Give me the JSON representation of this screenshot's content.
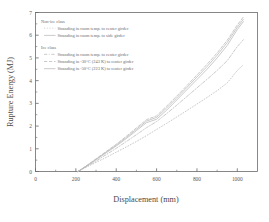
{
  "chart_data": {
    "type": "line",
    "title": "",
    "xlabel": "Displacement (mm)",
    "ylabel": "Rupture Energy (MJ)",
    "xlim": [
      0,
      1100
    ],
    "ylim": [
      0,
      7
    ],
    "xticks": [
      0,
      200,
      400,
      600,
      800,
      1000
    ],
    "yticks": [
      0,
      1,
      2,
      3,
      4,
      5,
      6,
      7
    ],
    "xtick_labels": [
      "0",
      "200",
      "400",
      "600",
      "800",
      "1000"
    ],
    "ytick_labels": [
      "0",
      "1",
      "2",
      "3",
      "4",
      "5",
      "6",
      "7"
    ],
    "grid": false,
    "legend_position": "upper-left",
    "legend_groups": [
      {
        "heading": "Non-ice class",
        "entries": [
          {
            "label": "Stranding in room temp. to center girder",
            "style": "dotted",
            "series": "noniceclass_room_center"
          },
          {
            "label": "Stranding in room temp. to side girder",
            "style": "solid",
            "series": "noniceclass_room_side"
          }
        ]
      },
      {
        "heading": "Ice class",
        "entries": [
          {
            "label": "Stranding in room temp. to center girder",
            "style": "dashdot",
            "series": "iceclass_room_center"
          },
          {
            "label": "Stranding in -30°C (243 K) to center girder",
            "style": "dashed",
            "series": "iceclass_m30_center"
          },
          {
            "label": "Stranding in -50°C (223 K) to center girder",
            "style": "solid",
            "series": "iceclass_m50_center"
          }
        ]
      }
    ],
    "series": [
      {
        "name": "Stranding in room temp. to center girder",
        "group": "Non-ice class",
        "style": "dotted",
        "key": "noniceclass_room_center",
        "x": [
          210,
          250,
          300,
          350,
          400,
          450,
          500,
          550,
          600,
          650,
          700,
          750,
          800,
          850,
          900,
          950,
          1000,
          1030
        ],
        "y": [
          0.0,
          0.18,
          0.4,
          0.62,
          0.85,
          1.08,
          1.32,
          1.58,
          1.85,
          2.12,
          2.4,
          2.68,
          2.97,
          3.26,
          3.56,
          3.9,
          4.45,
          4.7
        ]
      },
      {
        "name": "Stranding in room temp. to side girder",
        "group": "Non-ice class",
        "style": "solid",
        "key": "noniceclass_room_side",
        "x": [
          210,
          250,
          300,
          350,
          400,
          450,
          500,
          550,
          600,
          650,
          700,
          750,
          800,
          850,
          900,
          950,
          1000,
          1030
        ],
        "y": [
          0.0,
          0.22,
          0.52,
          0.82,
          1.12,
          1.45,
          1.8,
          2.15,
          2.3,
          2.7,
          3.15,
          3.6,
          4.05,
          4.5,
          5.0,
          5.55,
          6.25,
          6.6
        ]
      },
      {
        "name": "Stranding in room temp. to center girder",
        "group": "Ice class",
        "style": "dashdot",
        "key": "iceclass_room_center",
        "x": [
          210,
          250,
          300,
          350,
          400,
          450,
          500,
          550,
          600,
          650,
          700,
          750,
          800,
          850,
          900,
          950,
          1000,
          1030
        ],
        "y": [
          0.0,
          0.2,
          0.46,
          0.74,
          1.02,
          1.32,
          1.62,
          1.93,
          2.2,
          2.55,
          2.92,
          3.3,
          3.68,
          4.06,
          4.45,
          4.88,
          5.5,
          5.8
        ]
      },
      {
        "name": "Stranding in -30°C (243 K) to center girder",
        "group": "Ice class",
        "style": "dashed",
        "key": "iceclass_m30_center",
        "x": [
          210,
          250,
          300,
          350,
          400,
          450,
          500,
          550,
          600,
          650,
          700,
          750,
          800,
          850,
          900,
          950,
          1000,
          1030
        ],
        "y": [
          0.0,
          0.24,
          0.56,
          0.88,
          1.2,
          1.55,
          1.92,
          2.28,
          2.45,
          2.88,
          3.32,
          3.78,
          4.25,
          4.72,
          5.22,
          5.78,
          6.45,
          6.8
        ]
      },
      {
        "name": "Stranding in -50°C (223 K) to center girder",
        "group": "Ice class",
        "style": "solid",
        "key": "iceclass_m50_center",
        "x": [
          210,
          250,
          300,
          350,
          400,
          450,
          500,
          550,
          600,
          650,
          700,
          750,
          800,
          850,
          900,
          950,
          1000,
          1030
        ],
        "y": [
          0.0,
          0.23,
          0.54,
          0.85,
          1.16,
          1.5,
          1.86,
          2.22,
          2.38,
          2.8,
          3.24,
          3.7,
          4.16,
          4.62,
          5.12,
          5.68,
          6.35,
          6.7
        ]
      }
    ]
  },
  "colors": {
    "axis": "#6a6a6a",
    "curve": "#b8b8b8",
    "text": "#5a5a5a"
  }
}
